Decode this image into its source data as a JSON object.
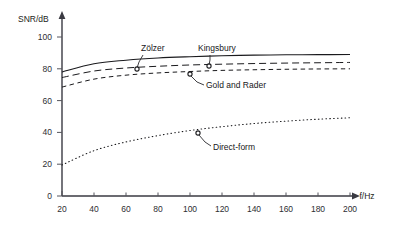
{
  "chart_data": {
    "type": "line",
    "title": "",
    "xlabel": "f/Hz",
    "ylabel": "SNR/dB",
    "xlim": [
      20,
      200
    ],
    "ylim": [
      0,
      100
    ],
    "grid": false,
    "legend_position": "inline-annotations",
    "xticks": [
      20,
      40,
      60,
      80,
      100,
      120,
      140,
      160,
      180,
      200
    ],
    "xtick_labels": [
      "20",
      "40",
      "60",
      "80",
      "100",
      "120",
      "140",
      "160",
      "180",
      "200"
    ],
    "yticks": [
      0,
      20,
      40,
      60,
      80,
      100
    ],
    "ytick_labels": [
      "0",
      "20",
      "40",
      "60",
      "80",
      "100"
    ],
    "x": [
      20,
      40,
      60,
      80,
      100,
      120,
      140,
      160,
      180,
      200
    ],
    "series": [
      {
        "name": "Zölzer",
        "style": "solid",
        "values": [
          78.0,
          83.2,
          85.4,
          86.8,
          87.6,
          88.2,
          88.6,
          88.8,
          88.9,
          89.0
        ],
        "annotation": {
          "label": "Zölzer",
          "label_x": 140,
          "label_y": 49,
          "marker_x": 137,
          "marker_y": 69,
          "leader": "137,68 139,62 140,56"
        }
      },
      {
        "name": "Kingsbury",
        "style": "dashed-long",
        "values": [
          74.5,
          78.6,
          80.5,
          81.6,
          82.4,
          82.9,
          83.3,
          83.6,
          83.8,
          84.0
        ],
        "annotation": {
          "label": "Kingsbury",
          "label_x": 200,
          "label_y": 49,
          "marker_x": 209,
          "marker_y": 66,
          "leader": "209,65 209,60 208,56"
        }
      },
      {
        "name": "Gold and Rader",
        "style": "dashed-short",
        "values": [
          68.5,
          73.5,
          76.0,
          77.4,
          78.3,
          79.0,
          79.4,
          79.7,
          79.9,
          80.0
        ],
        "annotation": {
          "label": "Gold and Rader",
          "label_x": 207,
          "label_y": 87,
          "marker_x": 190,
          "marker_y": 74,
          "leader": "191,75 198,82 204,84"
        }
      },
      {
        "name": "Direct-form",
        "style": "dotted",
        "values": [
          19.5,
          28.5,
          34.0,
          38.0,
          41.2,
          43.6,
          45.6,
          47.1,
          48.3,
          49.2
        ]
      }
    ],
    "annotations": [
      {
        "label": "Direct-form",
        "label_x": 213,
        "label_y": 148,
        "marker_x": 198,
        "marker_y": 133,
        "leader": "199,134 206,142 211,145"
      }
    ]
  },
  "axes": {
    "y_axis_title": "SNR/dB",
    "x_axis_title": "f/Hz"
  }
}
